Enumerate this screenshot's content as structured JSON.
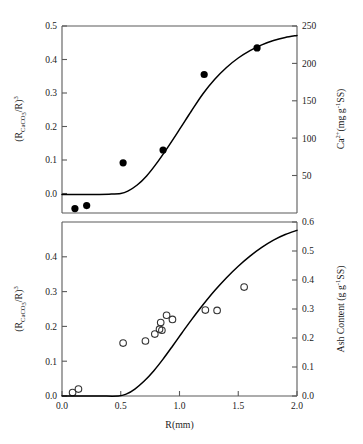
{
  "figure": {
    "x_axis_label": "R(mm)",
    "background_color": "#ffffff",
    "line_color": "#000000",
    "axis_color": "#5a5a5a"
  },
  "panels": {
    "top": {
      "left_axis_label": "(RCaCO3/R)3",
      "left_axis_label_parts": {
        "prefix": "(R",
        "sub1": "CaCO",
        "sub2": "3",
        "mid": "/R)",
        "sup": "3"
      },
      "right_axis_label_parts": {
        "prefix": "Ca",
        "sup1": "2+",
        "mid": "(mg g",
        "sup2": "-1",
        "suffix": "SS)"
      },
      "left_ticks": [
        "0.0",
        "0.1",
        "0.2",
        "0.3",
        "0.4",
        "0.5"
      ],
      "right_ticks": [
        "50",
        "100",
        "150",
        "200",
        "250"
      ]
    },
    "bottom": {
      "left_axis_label_parts": {
        "prefix": "(R",
        "sub1": "CaCO",
        "sub2": "3",
        "mid": "/R)",
        "sup": "3"
      },
      "right_axis_label_parts": {
        "prefix": "Ash Content (g g",
        "sup": "-1",
        "suffix": "SS)"
      },
      "left_ticks": [
        "0.0",
        "0.1",
        "0.2",
        "0.3",
        "0.4"
      ],
      "right_ticks": [
        "0.0",
        "0.1",
        "0.2",
        "0.3",
        "0.4",
        "0.5",
        "0.6"
      ],
      "x_ticks": [
        "0.0",
        "0.5",
        "1.0",
        "1.5",
        "2.0"
      ]
    }
  },
  "chart_data": [
    {
      "type": "scatter",
      "panel": "top",
      "title": "",
      "xlabel": "R(mm)",
      "ylabel": "(R_CaCO3/R)^3",
      "y2label": "Ca2+ (mg g-1 SS)",
      "xlim": [
        0.0,
        2.0
      ],
      "ylim": [
        -0.055,
        0.5
      ],
      "y2lim": [
        20,
        250
      ],
      "grid": false,
      "legend": false,
      "series": [
        {
          "name": "Ca2+ measurements",
          "marker": "filled-circle",
          "color": "#000000",
          "points": [
            {
              "x": 0.11,
              "y": -0.042
            },
            {
              "x": 0.21,
              "y": -0.033
            },
            {
              "x": 0.52,
              "y": 0.094
            },
            {
              "x": 0.86,
              "y": 0.132
            },
            {
              "x": 1.21,
              "y": 0.356
            },
            {
              "x": 1.66,
              "y": 0.435
            }
          ]
        },
        {
          "name": "Model curve",
          "marker": "line",
          "color": "#000000",
          "points": [
            {
              "x": 0.0,
              "y": 0.0
            },
            {
              "x": 0.2,
              "y": 0.0
            },
            {
              "x": 0.4,
              "y": 0.001
            },
            {
              "x": 0.5,
              "y": 0.003
            },
            {
              "x": 0.56,
              "y": 0.01
            },
            {
              "x": 0.64,
              "y": 0.028
            },
            {
              "x": 0.72,
              "y": 0.055
            },
            {
              "x": 0.8,
              "y": 0.09
            },
            {
              "x": 0.9,
              "y": 0.14
            },
            {
              "x": 1.0,
              "y": 0.193
            },
            {
              "x": 1.1,
              "y": 0.247
            },
            {
              "x": 1.2,
              "y": 0.299
            },
            {
              "x": 1.3,
              "y": 0.342
            },
            {
              "x": 1.4,
              "y": 0.377
            },
            {
              "x": 1.5,
              "y": 0.405
            },
            {
              "x": 1.6,
              "y": 0.427
            },
            {
              "x": 1.7,
              "y": 0.444
            },
            {
              "x": 1.8,
              "y": 0.457
            },
            {
              "x": 1.9,
              "y": 0.466
            },
            {
              "x": 2.0,
              "y": 0.472
            }
          ]
        }
      ]
    },
    {
      "type": "scatter",
      "panel": "bottom",
      "title": "",
      "xlabel": "R(mm)",
      "ylabel": "(R_CaCO3/R)^3",
      "y2label": "Ash Content (g g-1 SS)",
      "xlim": [
        0.0,
        2.0
      ],
      "ylim": [
        0.0,
        0.5
      ],
      "y2lim": [
        0.0,
        0.6
      ],
      "grid": false,
      "legend": false,
      "series": [
        {
          "name": "Ash content measurements",
          "marker": "open-circle",
          "color": "#333333",
          "points": [
            {
              "x": 0.09,
              "y": 0.01
            },
            {
              "x": 0.14,
              "y": 0.02
            },
            {
              "x": 0.52,
              "y": 0.152
            },
            {
              "x": 0.71,
              "y": 0.158
            },
            {
              "x": 0.79,
              "y": 0.178
            },
            {
              "x": 0.83,
              "y": 0.192
            },
            {
              "x": 0.84,
              "y": 0.211
            },
            {
              "x": 0.85,
              "y": 0.189
            },
            {
              "x": 0.89,
              "y": 0.232
            },
            {
              "x": 0.94,
              "y": 0.22
            },
            {
              "x": 1.22,
              "y": 0.247
            },
            {
              "x": 1.32,
              "y": 0.246
            },
            {
              "x": 1.55,
              "y": 0.313
            }
          ]
        },
        {
          "name": "Model curve",
          "marker": "line",
          "color": "#000000",
          "points": [
            {
              "x": 0.0,
              "y": 0.0
            },
            {
              "x": 0.3,
              "y": 0.0
            },
            {
              "x": 0.48,
              "y": 0.0
            },
            {
              "x": 0.55,
              "y": 0.006
            },
            {
              "x": 0.62,
              "y": 0.02
            },
            {
              "x": 0.7,
              "y": 0.043
            },
            {
              "x": 0.78,
              "y": 0.072
            },
            {
              "x": 0.86,
              "y": 0.106
            },
            {
              "x": 0.94,
              "y": 0.143
            },
            {
              "x": 1.02,
              "y": 0.181
            },
            {
              "x": 1.1,
              "y": 0.218
            },
            {
              "x": 1.2,
              "y": 0.262
            },
            {
              "x": 1.3,
              "y": 0.303
            },
            {
              "x": 1.4,
              "y": 0.34
            },
            {
              "x": 1.5,
              "y": 0.373
            },
            {
              "x": 1.6,
              "y": 0.402
            },
            {
              "x": 1.7,
              "y": 0.427
            },
            {
              "x": 1.8,
              "y": 0.448
            },
            {
              "x": 1.9,
              "y": 0.464
            },
            {
              "x": 2.0,
              "y": 0.476
            }
          ]
        }
      ]
    }
  ]
}
